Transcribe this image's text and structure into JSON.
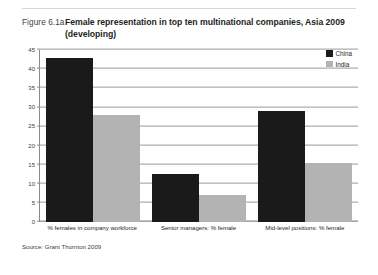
{
  "figure": {
    "number_label": "Figure 6.1a",
    "title": "Female representation in top ten multinational companies, Asia 2009 (developing)",
    "source": "Source: Grant Thornton 2009"
  },
  "chart_data": {
    "type": "bar",
    "title": "Female representation in top ten multinational companies, Asia 2009 (developing)",
    "categories": [
      "% females in company workforce",
      "Senior managers: % female",
      "Mid-level positions: % female"
    ],
    "series": [
      {
        "name": "China",
        "color": "#1a1a1a",
        "values": [
          43,
          12.5,
          29
        ]
      },
      {
        "name": "India",
        "color": "#b3b3b3",
        "values": [
          28,
          7,
          15.5
        ]
      }
    ],
    "xlabel": "",
    "ylabel": "",
    "ylim": [
      0,
      45
    ],
    "ytick_step": 5,
    "yticks": [
      0,
      5,
      10,
      15,
      20,
      25,
      30,
      35,
      40,
      45
    ],
    "grid": true,
    "legend_position": "top-right"
  }
}
